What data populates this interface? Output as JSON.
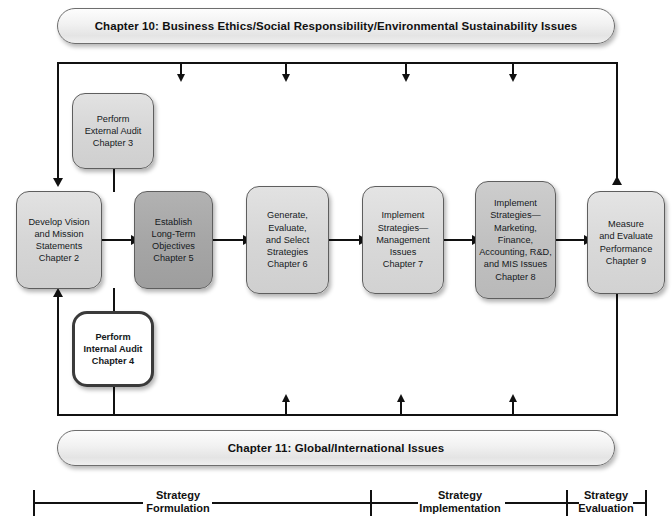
{
  "diagram": {
    "banners": {
      "top": "Chapter 10: Business Ethics/Social Responsibility/Environmental Sustainability Issues",
      "bottom": "Chapter 11:  Global/International Issues"
    },
    "boxes": [
      {
        "id": "external-audit",
        "text": "Perform\nExternal Audit\nChapter 3",
        "chapter": "Chapter 3",
        "shade": "#d6d6d6"
      },
      {
        "id": "vision-mission",
        "text": "Develop Vision\nand Mission\nStatements\nChapter 2",
        "chapter": "Chapter 2",
        "shade": "#d6d6d6"
      },
      {
        "id": "long-term-objectives",
        "text": "Establish\nLong-Term\nObjectives\nChapter 5",
        "chapter": "Chapter 5",
        "shade": "#a6a6a6"
      },
      {
        "id": "generate-select-strategies",
        "text": "Generate,\nEvaluate,\nand Select\nStrategies\nChapter 6",
        "chapter": "Chapter 6",
        "shade": "#d6d6d6"
      },
      {
        "id": "implement-management",
        "text": "Implement\nStrategies—\nManagement\nIssues\nChapter 7",
        "chapter": "Chapter 7",
        "shade": "#d9d9d9"
      },
      {
        "id": "implement-functional",
        "text": "Implement\nStrategies—\nMarketing,\nFinance,\nAccounting, R&D,\nand MIS Issues\nChapter 8",
        "chapter": "Chapter 8",
        "shade": "#c1c1c1"
      },
      {
        "id": "measure-evaluate",
        "text": "Measure\nand Evaluate\nPerformance\nChapter 9",
        "chapter": "Chapter 9",
        "shade": "#d9d9d9"
      },
      {
        "id": "internal-audit",
        "text": "Perform\nInternal Audit\nChapter 4",
        "chapter": "Chapter 4",
        "shade": "#ffffff"
      }
    ],
    "phases": [
      {
        "id": "strategy-formulation",
        "text": "Strategy\nFormulation"
      },
      {
        "id": "strategy-implementation",
        "text": "Strategy\nImplementation"
      },
      {
        "id": "strategy-evaluation",
        "text": "Strategy\nEvaluation"
      }
    ],
    "colors": {
      "line": "#111111",
      "box_border": "#5e5e5e",
      "banner_fill": "#e8e8e8",
      "highlight_box": "#a6a6a6",
      "white_box": "#ffffff"
    }
  }
}
